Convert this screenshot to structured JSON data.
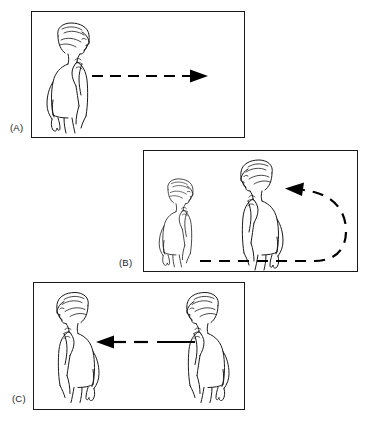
{
  "figure": {
    "background_color": "#ffffff",
    "ink_color": "#1a1a1a",
    "arrow_color": "#000000",
    "panel_count": 3
  },
  "panels": [
    {
      "id": "a",
      "label": "(A)",
      "label_position": "below-left",
      "figures": [
        {
          "name": "woman-facing-right",
          "position": "left",
          "facing": "right",
          "scale": "large",
          "pose": "hand raised to chin, standing in three-quarter back view"
        }
      ],
      "arrow": {
        "name": "dashed-arrow-right",
        "style": "dashed",
        "direction": "right",
        "head": "solid-triangle-right",
        "segments": 6
      }
    },
    {
      "id": "b",
      "label": "(B)",
      "label_position": "below-left",
      "figures": [
        {
          "name": "woman-facing-right-distant",
          "position": "left",
          "facing": "right",
          "scale": "small",
          "pose": "hand raised to chin, standing in three-quarter back view"
        },
        {
          "name": "woman-facing-left-near",
          "position": "center-right",
          "facing": "left",
          "scale": "large",
          "pose": "hand raised to chin, standing in three-quarter back view"
        }
      ],
      "arrow": {
        "name": "dashed-u-turn-arrow",
        "style": "dashed",
        "direction": "right-then-u-turn-then-left",
        "head": "solid-triangle-left",
        "segments": 8
      }
    },
    {
      "id": "c",
      "label": "(C)",
      "label_position": "below-left",
      "figures": [
        {
          "name": "woman-facing-left-left",
          "position": "left",
          "facing": "left",
          "scale": "large",
          "pose": "hand raised to chin, standing in three-quarter back view"
        },
        {
          "name": "woman-facing-left-right",
          "position": "right",
          "facing": "left",
          "scale": "large",
          "pose": "hand raised to chin, standing in three-quarter back view"
        }
      ],
      "arrow": {
        "name": "dashed-arrow-left",
        "style": "dashed-then-solid",
        "direction": "left",
        "head": "solid-triangle-left",
        "segments": 3
      }
    }
  ]
}
